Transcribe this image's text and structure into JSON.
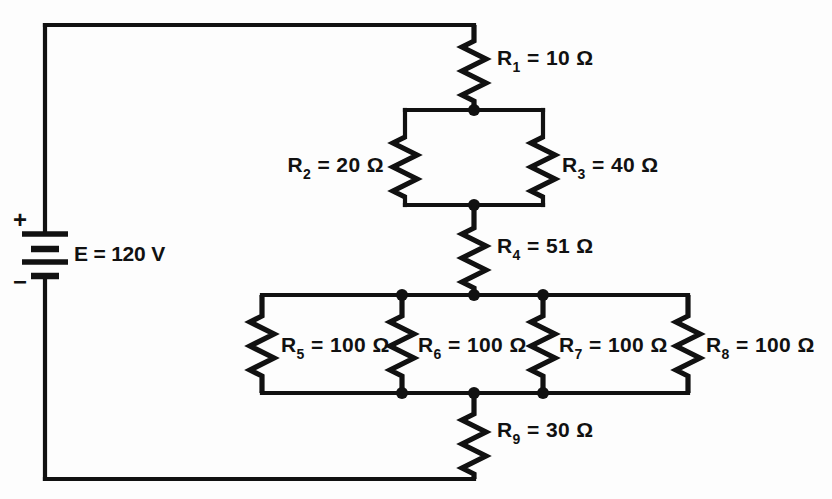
{
  "figure": {
    "name": "series-parallel-resistor-circuit",
    "background": "#ffffff",
    "ink": "#111111"
  },
  "source": {
    "symbol": "battery",
    "label": "E = 120 V",
    "plus_sign": "+",
    "minus_sign": "−",
    "voltage": 120,
    "unit": "V"
  },
  "components": {
    "r1": {
      "label": "R",
      "index": "1",
      "equals": " = 10 ",
      "ohm": "Ω",
      "value": 10,
      "unit": "Ω",
      "full": "R1 = 10 Ω"
    },
    "r2": {
      "label": "R",
      "index": "2",
      "equals": " = 20 ",
      "ohm": "Ω",
      "value": 20,
      "unit": "Ω",
      "full": "R2 = 20 Ω"
    },
    "r3": {
      "label": "R",
      "index": "3",
      "equals": " = 40 ",
      "ohm": "Ω",
      "value": 40,
      "unit": "Ω",
      "full": "R3 = 40 Ω"
    },
    "r4": {
      "label": "R",
      "index": "4",
      "equals": " = 51 ",
      "ohm": "Ω",
      "value": 51,
      "unit": "Ω",
      "full": "R4 = 51 Ω"
    },
    "r5": {
      "label": "R",
      "index": "5",
      "equals": " = 100 ",
      "ohm": "Ω",
      "value": 100,
      "unit": "Ω",
      "full": "R5 = 100 Ω"
    },
    "r6": {
      "label": "R",
      "index": "6",
      "equals": " = 100 ",
      "ohm": "Ω",
      "value": 100,
      "unit": "Ω",
      "full": "R6 = 100 Ω"
    },
    "r7": {
      "label": "R",
      "index": "7",
      "equals": " = 100 ",
      "ohm": "Ω",
      "value": 100,
      "unit": "Ω",
      "full": "R7 = 100 Ω"
    },
    "r8": {
      "label": "R",
      "index": "8",
      "equals": " = 100 ",
      "ohm": "Ω",
      "value": 100,
      "unit": "Ω",
      "full": "R8 = 100 Ω"
    },
    "r9": {
      "label": "R",
      "index": "9",
      "equals": " = 30 ",
      "ohm": "Ω",
      "value": 30,
      "unit": "Ω",
      "full": "R9 = 30 Ω"
    }
  },
  "topology": {
    "description": "R1 in series with parallel pair R2‖R3, then R4, then four parallel resistors R5‖R6‖R7‖R8, then R9, returned to a 120 V battery.",
    "series_chain": [
      "r1",
      "r2||r3",
      "r4",
      "r5||r6||r7||r8",
      "r9"
    ],
    "parallel_groups": [
      [
        "r2",
        "r3"
      ],
      [
        "r5",
        "r6",
        "r7",
        "r8"
      ]
    ]
  }
}
